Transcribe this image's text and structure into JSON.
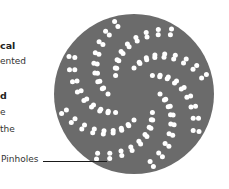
{
  "side_text": {
    "lines": [
      {
        "text": "cal",
        "bold": true,
        "x": 0,
        "y": 40
      },
      {
        "text": "ented",
        "bold": false,
        "x": 0,
        "y": 56
      },
      {
        "text": "d",
        "bold": true,
        "x": 0,
        "y": 90
      },
      {
        "text": "e",
        "bold": false,
        "x": 0,
        "y": 107
      },
      {
        "text": "the",
        "bold": false,
        "x": 0,
        "y": 124
      }
    ]
  },
  "callout": {
    "label": "Pinholes"
  },
  "disc": {
    "cx": 134,
    "cy": 94,
    "r": 80,
    "color": "#6b6b6b",
    "hole_color": "#ffffff",
    "hole_radius": 2.5,
    "arms": 8,
    "rows_per_arm": 2,
    "holes_per_row": 9,
    "inner_radius": 26,
    "outer_radius": 75,
    "twist_degrees": 75,
    "row_offset_degrees": 11
  }
}
